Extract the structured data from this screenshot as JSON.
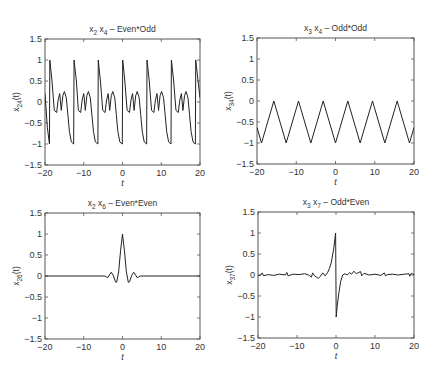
{
  "figure": {
    "panels": [
      {
        "id": "x24",
        "title_main": "x",
        "title_sub1": "2",
        "title_mid": " x",
        "title_sub2": "4",
        "title_rest": " – Even*Odd",
        "ylabel_main": "x",
        "ylabel_sub": "24",
        "ylabel_rest": "(t)",
        "xlabel": "t"
      },
      {
        "id": "x34",
        "title_main": "x",
        "title_sub1": "3",
        "title_mid": " x",
        "title_sub2": "4",
        "title_rest": " – Odd*Odd",
        "ylabel_main": "x",
        "ylabel_sub": "34",
        "ylabel_rest": "(t)",
        "xlabel": "t"
      },
      {
        "id": "x26",
        "title_main": "x",
        "title_sub1": "2",
        "title_mid": " x",
        "title_sub2": "6",
        "title_rest": " – Even*Even",
        "ylabel_main": "x",
        "ylabel_sub": "26",
        "ylabel_rest": "(t)",
        "xlabel": "t"
      },
      {
        "id": "x37",
        "title_main": "x",
        "title_sub1": "3",
        "title_mid": " x",
        "title_sub2": "7",
        "title_rest": " – Odd*Even",
        "ylabel_main": "x",
        "ylabel_sub": "37",
        "ylabel_rest": "(t)",
        "xlabel": "t"
      }
    ],
    "xticks": [
      "-20",
      "-10",
      "0",
      "10",
      "20"
    ],
    "yticks": [
      "-1.5",
      "-1",
      "-0.5",
      "0",
      "0.5",
      "1",
      "1.5"
    ],
    "line_color": "#222222",
    "axis_color": "#555555"
  },
  "chart_data": [
    {
      "type": "line",
      "title": "x2 x4 – Even*Odd",
      "xlabel": "t",
      "ylabel": "x24(t)",
      "xlim": [
        -20,
        20
      ],
      "ylim": [
        -1.5,
        1.5
      ],
      "grid": false,
      "description": "Periodic (period ≈ 2π) waveform: sharp rise from -1 to 1 near t = 2πk, then decay to about -0.25 with small ripples (±0.25) before the next sharp drop to -1.",
      "x": [
        -20,
        -19.4,
        -18.85,
        -18.75,
        -18.2,
        -17.6,
        -17.0,
        -16.6,
        -16.2,
        -15.8,
        -15.4,
        -15.0,
        -14.5,
        -14.1,
        -13.7,
        -13.2,
        -12.6,
        -12.5,
        -11.9,
        -11.4,
        -10.8,
        -10.4,
        -10.0,
        -9.6,
        -9.2,
        -8.8,
        -8.3,
        -7.9,
        -7.5,
        -7.0,
        -6.35,
        -6.25,
        -5.7,
        -5.1,
        -4.5,
        -4.1,
        -3.7,
        -3.3,
        -2.9,
        -2.5,
        -2.0,
        -1.6,
        -1.2,
        -0.7,
        -0.05,
        0.05,
        0.6,
        1.2,
        1.8,
        2.2,
        2.6,
        3.0,
        3.4,
        3.8,
        4.3,
        4.7,
        5.1,
        5.6,
        6.23,
        6.33,
        6.9,
        7.5,
        8.1,
        8.5,
        8.9,
        9.3,
        9.7,
        10.1,
        10.6,
        11.0,
        11.4,
        11.9,
        12.52,
        12.62,
        13.2,
        13.8,
        14.4,
        14.8,
        15.2,
        15.6,
        16.0,
        16.4,
        16.9,
        17.3,
        17.7,
        18.2,
        18.8,
        18.9,
        19.5,
        20
      ],
      "y": [
        0.2,
        -0.6,
        -1.0,
        1.0,
        0.5,
        -0.2,
        -0.25,
        0.05,
        0.2,
        -0.2,
        0.15,
        0.25,
        0.1,
        -0.3,
        -0.7,
        -0.95,
        -1.0,
        1.0,
        0.5,
        -0.2,
        -0.25,
        0.05,
        0.2,
        -0.2,
        0.15,
        0.25,
        0.1,
        -0.3,
        -0.7,
        -0.95,
        -1.0,
        1.0,
        0.5,
        -0.2,
        -0.25,
        0.05,
        0.2,
        -0.2,
        0.15,
        0.25,
        0.1,
        -0.3,
        -0.7,
        -0.95,
        -1.0,
        1.0,
        0.5,
        -0.2,
        -0.25,
        0.05,
        0.2,
        -0.2,
        0.15,
        0.25,
        0.1,
        -0.3,
        -0.7,
        -0.95,
        -1.0,
        1.0,
        0.5,
        -0.2,
        -0.25,
        0.05,
        0.2,
        -0.2,
        0.15,
        0.25,
        0.1,
        -0.3,
        -0.7,
        -0.95,
        -1.0,
        1.0,
        0.5,
        -0.2,
        -0.25,
        0.05,
        0.2,
        -0.2,
        0.15,
        0.25,
        0.1,
        -0.3,
        -0.7,
        -0.95,
        -1.0,
        1.0,
        0.5,
        0.1
      ]
    },
    {
      "type": "line",
      "title": "x3 x4 – Odd*Odd",
      "xlabel": "t",
      "ylabel": "x34(t)",
      "xlim": [
        -20,
        20
      ],
      "ylim": [
        -1.5,
        1.5
      ],
      "grid": false,
      "description": "Triangle wave between -1 and 0 with period ≈ 2π; minima at t = 2πk, maxima (0) at t = π(2k+1).",
      "x": [
        -20,
        -18.85,
        -15.71,
        -12.57,
        -9.42,
        -6.28,
        -3.14,
        0,
        3.14,
        6.28,
        9.42,
        12.57,
        15.71,
        18.85,
        20
      ],
      "y": [
        -0.63,
        -1,
        0,
        -1,
        0,
        -1,
        0,
        -1,
        0,
        -1,
        0,
        -1,
        0,
        -1,
        -0.63
      ]
    },
    {
      "type": "line",
      "title": "x2 x6 – Even*Even",
      "xlabel": "t",
      "ylabel": "x26(t)",
      "xlim": [
        -20,
        20
      ],
      "ylim": [
        -1.5,
        1.5
      ],
      "grid": false,
      "description": "Even pulse: zero except near t=0, peak 1 at t=0, side lobes -0.15 at t≈±1.6, +0.09 at t≈±2.9, small dips at t≈±4.",
      "x": [
        -20,
        -4.6,
        -4.2,
        -3.8,
        -3.4,
        -2.9,
        -2.4,
        -1.8,
        -1.5,
        -1.0,
        -0.5,
        0,
        0.5,
        1.0,
        1.5,
        1.8,
        2.4,
        2.9,
        3.4,
        3.8,
        4.2,
        4.6,
        20
      ],
      "y": [
        0,
        0,
        -0.02,
        -0.04,
        0.02,
        0.09,
        0.02,
        -0.14,
        -0.15,
        0.1,
        0.6,
        1.0,
        0.6,
        0.1,
        -0.15,
        -0.14,
        0.02,
        0.09,
        0.02,
        -0.04,
        -0.02,
        0,
        0
      ]
    },
    {
      "type": "line",
      "title": "x3 x7 – Odd*Even",
      "xlabel": "t",
      "ylabel": "x37(t)",
      "xlim": [
        -20,
        20
      ],
      "ylim": [
        -1.5,
        1.5
      ],
      "grid": false,
      "description": "Odd waveform: near zero with small ripples; rises to 1 just before t=0, drops sharply to -1 just after t=0, then recovers.",
      "x": [
        -20,
        -19.3,
        -18.9,
        -18.6,
        -17.5,
        -16,
        -14.5,
        -13,
        -12.6,
        -12.3,
        -11,
        -9.5,
        -8,
        -7,
        -6.3,
        -6,
        -5.5,
        -5,
        -4.5,
        -4,
        -3.4,
        -2.8,
        -2.2,
        -1.7,
        -1.2,
        -0.6,
        -0.1,
        0.05,
        0.3,
        0.7,
        1.2,
        1.7,
        2.3,
        2.9,
        3.5,
        4.0,
        4.6,
        5.2,
        5.8,
        6.3,
        6.6,
        7.2,
        8.5,
        10,
        11.5,
        12.4,
        12.7,
        13.2,
        14.5,
        16,
        17.5,
        18.7,
        18.9,
        19.3,
        20
      ],
      "y": [
        -0.02,
        0.0,
        0.05,
        -0.02,
        0.01,
        -0.01,
        0.02,
        0.0,
        0.06,
        -0.02,
        0.02,
        0.01,
        0.03,
        0.0,
        -0.05,
        0.05,
        -0.02,
        -0.05,
        -0.08,
        -0.03,
        0.05,
        -0.02,
        0.05,
        0.15,
        0.3,
        0.62,
        1.0,
        -1.0,
        -0.75,
        -0.45,
        -0.15,
        0.0,
        0.03,
        0.0,
        0.06,
        0.02,
        0.09,
        0.03,
        0.06,
        0.08,
        -0.02,
        0.04,
        0.0,
        0.02,
        -0.01,
        0.05,
        -0.02,
        0.01,
        0.02,
        0.0,
        0.02,
        0.03,
        -0.03,
        0.04,
        0.01
      ]
    }
  ]
}
